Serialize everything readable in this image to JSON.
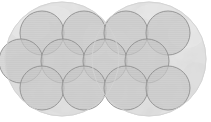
{
  "figure": {
    "title": "Overlapping circles lattice diagram",
    "width": 211,
    "height": 122,
    "background_color": "#ffffff"
  },
  "chart_data": {
    "type": "diagram",
    "subtype": "overlapping-circles-lattice",
    "title": "Overlapping circles lattice diagram",
    "xlabel": "",
    "ylabel": "",
    "xlim": [
      0,
      211
    ],
    "ylim": [
      0,
      122
    ],
    "grid": false,
    "legend": false,
    "background_color": "#ffffff",
    "palette": {
      "large_circle_fill": "#e3e3e3",
      "large_circle_stroke": "#d6d6d6",
      "small_circle_fill": "#c9c9c9",
      "small_circle_stroke": "#9a9a9a",
      "mottle_light": "#ededed",
      "mottle_dark": "#d4d4d4"
    },
    "series": [
      {
        "name": "large-circles",
        "role": "backdrop",
        "fill": "#e3e3e3",
        "stroke": "#d6d6d6",
        "radius": 57,
        "count": 2,
        "circles": [
          {
            "id": "large-left",
            "cx": 62,
            "cy": 59,
            "r": 57
          },
          {
            "id": "large-right",
            "cx": 149,
            "cy": 59,
            "r": 57
          }
        ]
      },
      {
        "name": "small-circles",
        "role": "lattice",
        "fill": "#c9c9c9",
        "stroke": "#8e8e8e",
        "radius": 22,
        "count": 12,
        "circles": [
          {
            "id": "top-1",
            "cx": 42,
            "cy": 33,
            "r": 22,
            "row": "top",
            "col": 1
          },
          {
            "id": "top-2",
            "cx": 84,
            "cy": 33,
            "r": 22,
            "row": "top",
            "col": 2
          },
          {
            "id": "top-3",
            "cx": 126,
            "cy": 33,
            "r": 22,
            "row": "top",
            "col": 3
          },
          {
            "id": "top-4",
            "cx": 168,
            "cy": 33,
            "r": 22,
            "row": "top",
            "col": 4
          },
          {
            "id": "mid-1",
            "cx": 63,
            "cy": 61,
            "r": 22,
            "row": "middle",
            "col": 1
          },
          {
            "id": "mid-2",
            "cx": 105,
            "cy": 61,
            "r": 22,
            "row": "middle",
            "col": 2
          },
          {
            "id": "mid-3",
            "cx": 147,
            "cy": 61,
            "r": 22,
            "row": "middle",
            "col": 3
          },
          {
            "id": "mid-4",
            "cx": 21,
            "cy": 61,
            "r": 22,
            "row": "middle",
            "col": 0
          },
          {
            "id": "bot-1",
            "cx": 42,
            "cy": 88,
            "r": 22,
            "row": "bottom",
            "col": 1
          },
          {
            "id": "bot-2",
            "cx": 84,
            "cy": 88,
            "r": 22,
            "row": "bottom",
            "col": 2
          },
          {
            "id": "bot-3",
            "cx": 126,
            "cy": 88,
            "r": 22,
            "row": "bottom",
            "col": 3
          },
          {
            "id": "bot-4",
            "cx": 168,
            "cy": 88,
            "r": 22,
            "row": "bottom",
            "col": 4
          }
        ]
      }
    ],
    "annotations": [],
    "tick_labels": {
      "x": [],
      "y": []
    }
  }
}
